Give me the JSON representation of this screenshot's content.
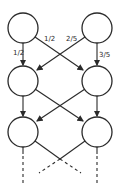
{
  "diagram": {
    "type": "markov-chain-trellis",
    "columns": 2,
    "rows_shown": 3,
    "continues_below": true,
    "labels": {
      "left_stay": "1/2",
      "left_to_right": "1/2",
      "right_to_left": "2/5",
      "right_stay": "3/5"
    },
    "colors": {
      "stroke": "#2a2a2a",
      "background": "#ffffff"
    }
  }
}
